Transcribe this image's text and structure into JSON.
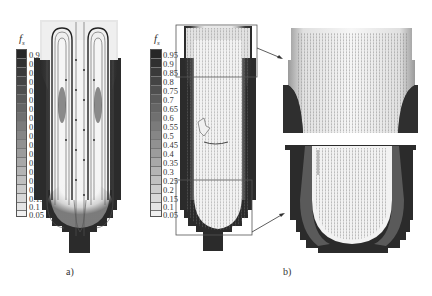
{
  "figure": {
    "panel_a": {
      "label": "a)",
      "legend": {
        "symbol": "f",
        "subscript": "s",
        "ticks": [
          "0.95",
          "0.9",
          "0.85",
          "0.8",
          "0.75",
          "0.7",
          "0.65",
          "0.6",
          "0.55",
          "0.5",
          "0.45",
          "0.4",
          "0.35",
          "0.3",
          "0.25",
          "0.2",
          "0.15",
          "0.1",
          "0.05"
        ]
      },
      "description": "Solid fraction contour with streamlines in casting"
    },
    "panel_b": {
      "label": "b)",
      "legend": {
        "symbol": "f",
        "subscript": "s",
        "ticks": [
          "0.95",
          "0.9",
          "0.85",
          "0.8",
          "0.75",
          "0.7",
          "0.65",
          "0.6",
          "0.55",
          "0.5",
          "0.45",
          "0.4",
          "0.35",
          "0.3",
          "0.25",
          "0.2",
          "0.15",
          "0.1",
          "0.05"
        ]
      },
      "description": "Solid fraction contour with velocity vectors; upper and lower regions magnified"
    },
    "colors": {
      "solid": "#2b2b2b",
      "liquid": "#f4f4f4",
      "box": "#555555",
      "background": "#ffffff"
    }
  }
}
